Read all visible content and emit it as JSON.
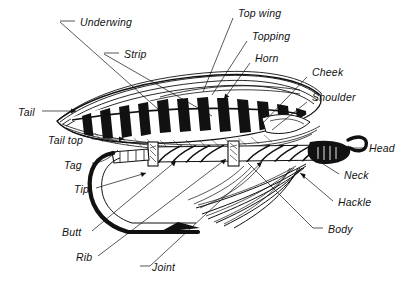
{
  "diagram": {
    "style": "black-and-white pen-and-ink engraving",
    "background_color": "#ffffff",
    "ink_color": "#111111",
    "label_font_style": "italic sans-serif",
    "label_count": 17
  },
  "labels": [
    {
      "id": "underwing",
      "text": "Underwing",
      "x": 80,
      "y": 24,
      "anchor": "left"
    },
    {
      "id": "strip",
      "text": "Strip",
      "x": 124,
      "y": 56,
      "anchor": "left"
    },
    {
      "id": "tail",
      "text": "Tail",
      "x": 18,
      "y": 114,
      "anchor": "left"
    },
    {
      "id": "tail-top",
      "text": "Tail top",
      "x": 48,
      "y": 142,
      "anchor": "left"
    },
    {
      "id": "tag",
      "text": "Tag",
      "x": 64,
      "y": 167,
      "anchor": "left"
    },
    {
      "id": "tip",
      "text": "Tip",
      "x": 74,
      "y": 191,
      "anchor": "left"
    },
    {
      "id": "butt",
      "text": "Butt",
      "x": 62,
      "y": 234,
      "anchor": "left"
    },
    {
      "id": "rib",
      "text": "Rib",
      "x": 76,
      "y": 259,
      "anchor": "left"
    },
    {
      "id": "joint",
      "text": "Joint",
      "x": 146,
      "y": 269,
      "anchor": "left"
    },
    {
      "id": "top-wing",
      "text": "Top  wing",
      "x": 238,
      "y": 15,
      "anchor": "left"
    },
    {
      "id": "topping",
      "text": "Topping",
      "x": 252,
      "y": 38,
      "anchor": "left"
    },
    {
      "id": "horn",
      "text": "Horn",
      "x": 255,
      "y": 60,
      "anchor": "left"
    },
    {
      "id": "cheek",
      "text": "Cheek",
      "x": 312,
      "y": 74,
      "anchor": "left"
    },
    {
      "id": "shoulder",
      "text": "Shoulder",
      "x": 312,
      "y": 99,
      "anchor": "left"
    },
    {
      "id": "head",
      "text": "Head",
      "x": 369,
      "y": 150,
      "anchor": "left"
    },
    {
      "id": "neck",
      "text": "Neck",
      "x": 344,
      "y": 177,
      "anchor": "left"
    },
    {
      "id": "hackle",
      "text": "Hackle",
      "x": 338,
      "y": 204,
      "anchor": "left"
    },
    {
      "id": "body",
      "text": "Body",
      "x": 328,
      "y": 231,
      "anchor": "left"
    }
  ],
  "leader_lines": [
    {
      "for": "underwing",
      "from": [
        75,
        21
      ],
      "to": [
        60,
        21
      ],
      "kind": "dash-left"
    },
    {
      "for": "underwing",
      "from": [
        60,
        22
      ],
      "to": [
        168,
        118
      ],
      "kind": "pointer"
    },
    {
      "for": "strip",
      "from": [
        119,
        53
      ],
      "to": [
        104,
        53
      ],
      "kind": "dash-left"
    },
    {
      "for": "strip",
      "from": [
        104,
        54
      ],
      "to": [
        212,
        115
      ],
      "kind": "pointer"
    },
    {
      "for": "tail",
      "from": [
        42,
        111
      ],
      "to": [
        80,
        111
      ],
      "kind": "arrow-right"
    },
    {
      "for": "tail-top",
      "from": [
        92,
        139
      ],
      "to": [
        128,
        139
      ],
      "kind": "arrow-right"
    },
    {
      "for": "tag",
      "from": [
        92,
        163
      ],
      "to": [
        120,
        150
      ],
      "kind": "curve"
    },
    {
      "for": "tip",
      "from": [
        96,
        188
      ],
      "to": [
        150,
        172
      ],
      "kind": "arrow"
    },
    {
      "for": "butt",
      "from": [
        92,
        231
      ],
      "to": [
        178,
        160
      ],
      "kind": "arrow"
    },
    {
      "for": "rib",
      "from": [
        98,
        256
      ],
      "to": [
        228,
        158
      ],
      "kind": "arrow"
    },
    {
      "for": "joint",
      "from": [
        140,
        266
      ],
      "to": [
        262,
        160
      ],
      "kind": "arrow"
    },
    {
      "for": "top-wing",
      "from": [
        233,
        18
      ],
      "to": [
        205,
        92
      ],
      "kind": "pointer"
    },
    {
      "for": "topping",
      "from": [
        247,
        41
      ],
      "to": [
        212,
        96
      ],
      "kind": "pointer"
    },
    {
      "for": "horn",
      "from": [
        250,
        63
      ],
      "to": [
        222,
        100
      ],
      "kind": "arrow"
    },
    {
      "for": "cheek",
      "from": [
        307,
        77
      ],
      "to": [
        262,
        122
      ],
      "kind": "pointer"
    },
    {
      "for": "shoulder",
      "from": [
        307,
        102
      ],
      "to": [
        272,
        128
      ],
      "kind": "pointer"
    },
    {
      "for": "head",
      "from": [
        364,
        148
      ],
      "to": [
        340,
        148
      ],
      "kind": "arrow-left"
    },
    {
      "for": "neck",
      "from": [
        339,
        174
      ],
      "to": [
        312,
        156
      ],
      "kind": "arrow"
    },
    {
      "for": "hackle",
      "from": [
        333,
        201
      ],
      "to": [
        300,
        172
      ],
      "kind": "arrow"
    },
    {
      "for": "body",
      "from": [
        323,
        228
      ],
      "to": [
        248,
        162
      ],
      "kind": "pointer"
    }
  ],
  "fly_parts": {
    "wing": {
      "description": "broad barred black-and-white married wing sweeping from lower-left to upper-right",
      "bars": 11
    },
    "body": {
      "description": "tapered body with spiral rib and two joint bands"
    },
    "hook": {
      "description": "down-eye hook with deep bend, point and barb"
    },
    "head": {
      "description": "solid black head behind the looped eye"
    },
    "hackle": {
      "description": "swept-back throat hackle fibers"
    }
  }
}
